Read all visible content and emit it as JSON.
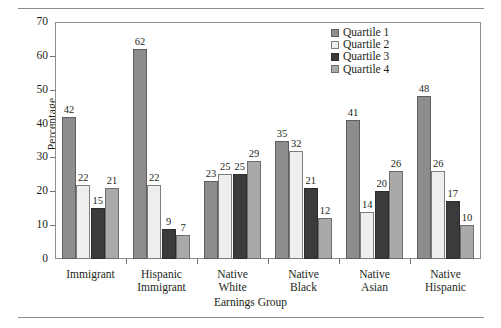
{
  "chart_data": {
    "type": "bar",
    "title": "",
    "xlabel": "Earnings Group",
    "ylabel": "Percentage",
    "ylim": [
      0,
      70
    ],
    "yticks": [
      0,
      10,
      20,
      30,
      40,
      50,
      60,
      70
    ],
    "grid": false,
    "legend_position": "top-right",
    "categories": [
      "Immigrant",
      "Hispanic\nImmigrant",
      "Native\nWhite",
      "Native\nBlack",
      "Native\nAsian",
      "Native\nHispanic"
    ],
    "series": [
      {
        "name": "Quartile 1",
        "color": "#8d8d8d",
        "values": [
          42,
          62,
          23,
          35,
          41,
          48
        ]
      },
      {
        "name": "Quartile 2",
        "color": "#eeeeec",
        "values": [
          22,
          22,
          25,
          32,
          14,
          26
        ]
      },
      {
        "name": "Quartile 3",
        "color": "#3b3b3b",
        "values": [
          15,
          9,
          25,
          21,
          20,
          17
        ]
      },
      {
        "name": "Quartile 4",
        "color": "#a9a9a9",
        "values": [
          21,
          7,
          29,
          12,
          26,
          10
        ]
      }
    ],
    "data_labels_shown": true
  },
  "legend": {
    "items": [
      {
        "label": "Quartile 1"
      },
      {
        "label": "Quartile 2"
      },
      {
        "label": "Quartile 3"
      },
      {
        "label": "Quartile 4"
      }
    ]
  }
}
